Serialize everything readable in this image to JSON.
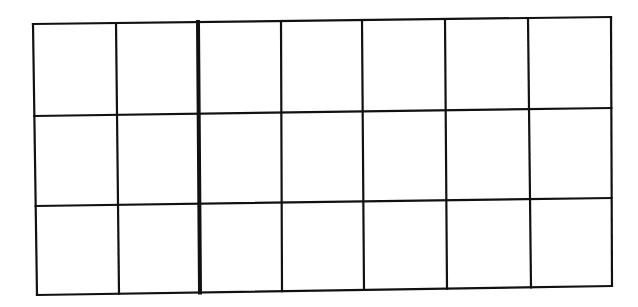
{
  "diagram": {
    "type": "grid",
    "rows": 3,
    "columns": 7,
    "line_color": "#111111",
    "background": "#ffffff",
    "thick_divider_after_column": 2,
    "outer_border": {
      "top_left": [
        33,
        24
      ],
      "top_right": [
        611,
        17
      ],
      "bottom_right": [
        612,
        286
      ],
      "bottom_left": [
        37,
        295
      ]
    },
    "vertical_lines_top_x": [
      33,
      116,
      198,
      281,
      362,
      445,
      528,
      611
    ],
    "vertical_lines_bottom_x": [
      37,
      119,
      200,
      282,
      364,
      447,
      531,
      612
    ],
    "horizontal_lines_left_y": [
      24,
      116,
      206,
      295
    ],
    "horizontal_lines_right_y": [
      17,
      108,
      198,
      286
    ]
  }
}
